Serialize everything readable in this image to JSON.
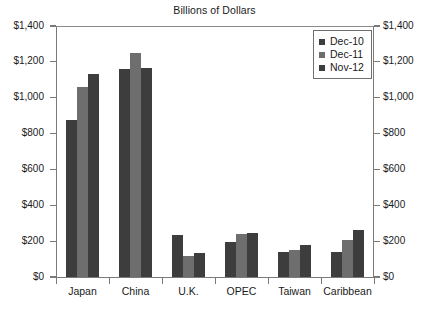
{
  "chart_data": {
    "type": "bar",
    "title": "Billions of Dollars",
    "xlabel": "",
    "ylabel": "",
    "ylim": [
      0,
      1400
    ],
    "ytick_step": 200,
    "grid": false,
    "legend_position": "top-right",
    "dual_axis": true,
    "categories": [
      "Japan",
      "China",
      "U.K.",
      "OPEC",
      "Taiwan",
      "Caribbean"
    ],
    "ytick_labels": [
      "$0",
      "$200",
      "$400",
      "$600",
      "$800",
      "$1,000",
      "$1,200",
      "$1,400"
    ],
    "ytick_values": [
      0,
      200,
      400,
      600,
      800,
      1000,
      1200,
      1400
    ],
    "series": [
      {
        "name": "Dec-10",
        "color": "#3d3d3d",
        "values": [
          875,
          1160,
          235,
          195,
          140,
          142
        ]
      },
      {
        "name": "Dec-11",
        "color": "#6e6e6e",
        "values": [
          1060,
          1250,
          120,
          240,
          150,
          205
        ]
      },
      {
        "name": "Nov-12",
        "color": "#3d3d3d",
        "values": [
          1130,
          1165,
          135,
          248,
          178,
          265
        ]
      }
    ]
  },
  "axes": {
    "left_labels": [
      "$1,400",
      "$1,200",
      "$1,000",
      "$800",
      "$600",
      "$400",
      "$200",
      "$0"
    ],
    "right_labels": [
      "$1,400",
      "$1,200",
      "$1,000",
      "$800",
      "$600",
      "$400",
      "$200",
      "$0"
    ]
  },
  "legend": {
    "items": [
      {
        "label": "Dec-10",
        "color": "#3d3d3d"
      },
      {
        "label": "Dec-11",
        "color": "#6e6e6e"
      },
      {
        "label": "Nov-12",
        "color": "#3d3d3d"
      }
    ]
  }
}
